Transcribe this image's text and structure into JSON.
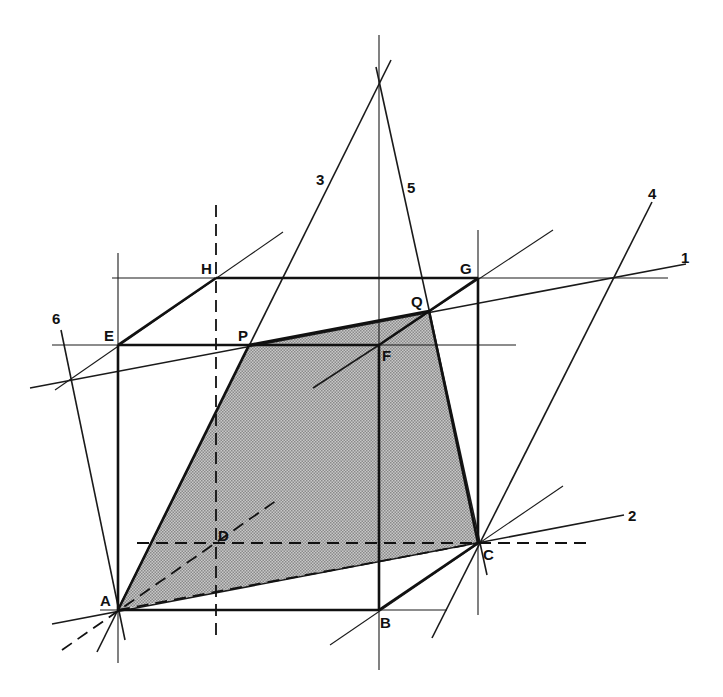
{
  "diagram": {
    "type": "geometric-construction",
    "fill_color": "#b9b9b9",
    "points": {
      "A": {
        "label": "A",
        "x": 118,
        "y": 610
      },
      "B": {
        "label": "B",
        "x": 379,
        "y": 610
      },
      "C": {
        "label": "C",
        "x": 478,
        "y": 543
      },
      "D": {
        "label": "D",
        "x": 216,
        "y": 543
      },
      "E": {
        "label": "E",
        "x": 119,
        "y": 345
      },
      "F": {
        "label": "F",
        "x": 379,
        "y": 345
      },
      "G": {
        "label": "G",
        "x": 478,
        "y": 278
      },
      "H": {
        "label": "H",
        "x": 216,
        "y": 278
      },
      "P": {
        "label": "P",
        "x": 249,
        "y": 345
      },
      "Q": {
        "label": "Q",
        "x": 429,
        "y": 311
      }
    },
    "line_labels": [
      {
        "id": "1",
        "label": "1",
        "x": 686,
        "y": 264
      },
      {
        "id": "2",
        "label": "2",
        "x": 630,
        "y": 521
      },
      {
        "id": "3",
        "label": "3",
        "x": 313,
        "y": 184
      },
      {
        "id": "4",
        "label": "4",
        "x": 648,
        "y": 200
      },
      {
        "id": "5",
        "label": "5",
        "x": 405,
        "y": 190
      },
      {
        "id": "6",
        "label": "6",
        "x": 50,
        "y": 325
      }
    ],
    "section_polygon": [
      "A",
      "P",
      "Q",
      "C"
    ]
  }
}
